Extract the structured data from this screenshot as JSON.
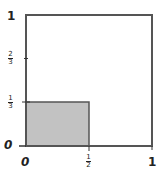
{
  "diagram": {
    "title": "",
    "square": {
      "x_range": [
        0,
        1
      ],
      "y_range": [
        0,
        1
      ]
    },
    "shaded_region": {
      "x": [
        0,
        0.5
      ],
      "y": [
        0,
        0.3333
      ],
      "fill": "#c2c2c2"
    },
    "colors": {
      "line": "#555555",
      "fill": "#c2c2c2",
      "text": "#222222"
    },
    "x_axis": {
      "ticks": [
        {
          "value": 0,
          "label": "0"
        },
        {
          "value": 0.5,
          "label_num": "1",
          "label_den": "2"
        },
        {
          "value": 1,
          "label": "1"
        }
      ]
    },
    "y_axis": {
      "ticks": [
        {
          "value": 0,
          "label": "0"
        },
        {
          "value": 0.3333,
          "label_num": "1",
          "label_den": "3"
        },
        {
          "value": 0.6667,
          "label_num": "2",
          "label_den": "3"
        },
        {
          "value": 1,
          "label": "1"
        }
      ]
    }
  }
}
